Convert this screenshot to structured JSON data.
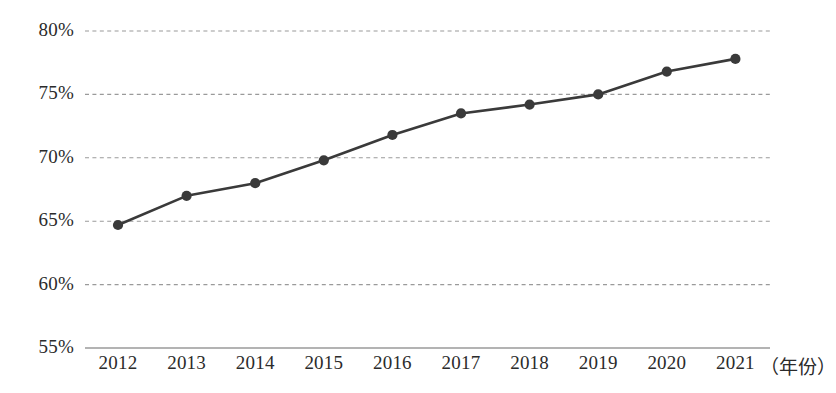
{
  "chart_data": {
    "type": "line",
    "title": "",
    "subtitle": "",
    "xlabel": "（年份）",
    "ylabel": "",
    "categories": [
      "2012",
      "2013",
      "2014",
      "2015",
      "2016",
      "2017",
      "2018",
      "2019",
      "2020",
      "2021"
    ],
    "values": [
      64.7,
      67.0,
      68.0,
      69.8,
      71.8,
      73.5,
      74.2,
      75.0,
      76.8,
      77.8
    ],
    "series": [
      {
        "name": "",
        "values": [
          64.7,
          67.0,
          68.0,
          69.8,
          71.8,
          73.5,
          74.2,
          75.0,
          76.8,
          77.8
        ]
      }
    ],
    "ylim": [
      55,
      80
    ],
    "ytick_values": [
      80,
      75,
      70,
      65,
      60,
      55
    ],
    "ytick_labels": [
      "80%",
      "75%",
      "70%",
      "65%",
      "60%",
      "55%"
    ],
    "xtick_labels": [
      "2012",
      "2013",
      "2014",
      "2015",
      "2016",
      "2017",
      "2018",
      "2019",
      "2020",
      "2021"
    ],
    "grid": true,
    "grid_style": "dashed",
    "legend": "none",
    "legend_position": "none",
    "annotations": [],
    "colors": {
      "line": "#3a3a3a",
      "marker": "#3a3a3a",
      "grid": "#9a9a9a",
      "axis": "#9a9a9a",
      "text": "#2b2b2b",
      "background": "#ffffff"
    }
  },
  "axis": {
    "x_title": "（年份）",
    "y_ticks": [
      {
        "label": "80%",
        "value": 80
      },
      {
        "label": "75%",
        "value": 75
      },
      {
        "label": "70%",
        "value": 70
      },
      {
        "label": "65%",
        "value": 65
      },
      {
        "label": "60%",
        "value": 60
      },
      {
        "label": "55%",
        "value": 55
      }
    ],
    "x_ticks": [
      {
        "label": "2012",
        "value": 64.7
      },
      {
        "label": "2013",
        "value": 67.0
      },
      {
        "label": "2014",
        "value": 68.0
      },
      {
        "label": "2015",
        "value": 69.8
      },
      {
        "label": "2016",
        "value": 71.8
      },
      {
        "label": "2017",
        "value": 73.5
      },
      {
        "label": "2018",
        "value": 74.2
      },
      {
        "label": "2019",
        "value": 75.0
      },
      {
        "label": "2020",
        "value": 76.8
      },
      {
        "label": "2021",
        "value": 77.8
      }
    ]
  }
}
